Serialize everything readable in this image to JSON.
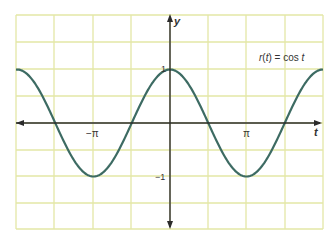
{
  "chart_data": {
    "type": "line",
    "title": "",
    "function_label": "r(t) = cos t",
    "xlabel": "t",
    "ylabel": "y",
    "x_tick_labels": [
      "−π",
      "π"
    ],
    "x_ticks": [
      -3.14159,
      3.14159
    ],
    "y_tick_labels": [
      "1",
      "−1"
    ],
    "y_ticks": [
      1,
      -1
    ],
    "xlim": [
      -6.6,
      6.6
    ],
    "ylim": [
      -2.0,
      2.0
    ],
    "grid": true,
    "series": [
      {
        "name": "r(t) = cos t",
        "x": [
          -6.6,
          -6.283,
          -4.712,
          -3.142,
          -1.571,
          0,
          1.571,
          3.142,
          4.712,
          6.283,
          6.6
        ],
        "values": [
          0.95,
          1,
          0,
          -1,
          0,
          1,
          0,
          -1,
          0,
          1,
          0.95
        ]
      }
    ],
    "colors": {
      "grid": "#e3e7a6",
      "curve": "#3d6b63",
      "axes": "#2b2b2b"
    }
  },
  "labels": {
    "y_axis": "y",
    "t_axis": "t",
    "neg_pi": "−π",
    "pi": "π",
    "one": "1",
    "neg_one": "−1",
    "function": "r(t) = cos t"
  }
}
